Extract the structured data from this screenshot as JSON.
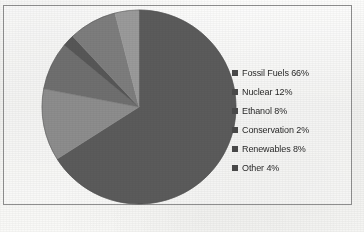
{
  "figure": {
    "border_color": "#8f8f8f",
    "background_color": "#fbfbfa"
  },
  "chart_data": {
    "type": "pie",
    "title": "",
    "xlabel": "",
    "ylabel": "",
    "legend_position": "right",
    "grid": false,
    "start_angle_deg": 0,
    "direction": "clockwise",
    "categories": [
      "Fossil Fuels",
      "Nuclear",
      "Ethanol",
      "Conservation",
      "Renewables",
      "Other"
    ],
    "values": [
      66,
      12,
      8,
      2,
      8,
      4
    ],
    "unit": "%",
    "labels": [
      "Fossil Fuels 66%",
      "Nuclear 12%",
      "Ethanol 8%",
      "Conservation 2%",
      "Renewables 8%",
      "Other 4%"
    ],
    "colors": [
      "#5b5b5b",
      "#8d8d8d",
      "#6f6f6f",
      "#575757",
      "#7d7d7d",
      "#9a9a9a"
    ],
    "slices": [
      {
        "name": "Fossil Fuels",
        "value": 66,
        "label": "Fossil Fuels 66%",
        "color": "#5b5b5b",
        "start_deg": 0,
        "end_deg": 237.6
      },
      {
        "name": "Nuclear",
        "value": 12,
        "label": "Nuclear 12%",
        "color": "#8d8d8d",
        "start_deg": 237.6,
        "end_deg": 280.8
      },
      {
        "name": "Ethanol",
        "value": 8,
        "label": "Ethanol 8%",
        "color": "#6f6f6f",
        "start_deg": 280.8,
        "end_deg": 309.6
      },
      {
        "name": "Conservation",
        "value": 2,
        "label": "Conservation 2%",
        "color": "#575757",
        "start_deg": 309.6,
        "end_deg": 316.8
      },
      {
        "name": "Renewables",
        "value": 8,
        "label": "Renewables 8%",
        "color": "#7d7d7d",
        "start_deg": 316.8,
        "end_deg": 345.6
      },
      {
        "name": "Other",
        "value": 4,
        "label": "Other 4%",
        "color": "#9a9a9a",
        "start_deg": 345.6,
        "end_deg": 360
      }
    ]
  },
  "legend": {
    "items": [
      {
        "label": "Fossil Fuels 66%",
        "swatch_color": "#4a4a4a"
      },
      {
        "label": "Nuclear 12%",
        "swatch_color": "#4a4a4a"
      },
      {
        "label": "Ethanol 8%",
        "swatch_color": "#4a4a4a"
      },
      {
        "label": "Conservation 2%",
        "swatch_color": "#4a4a4a"
      },
      {
        "label": "Renewables 8%",
        "swatch_color": "#4a4a4a"
      },
      {
        "label": "Other 4%",
        "swatch_color": "#4a4a4a"
      }
    ]
  }
}
